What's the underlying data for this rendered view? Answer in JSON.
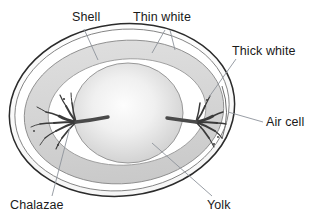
{
  "diagram": {
    "type": "labeled-biological-diagram",
    "labels": [
      {
        "id": "shell",
        "text": "Shell",
        "icon": "leader-line-icon",
        "position": "top-left",
        "points_to": "outer shell boundary"
      },
      {
        "id": "thin-white",
        "text": "Thin white",
        "icon": "leader-line-icon",
        "position": "top-center",
        "points_to": "thin albumen layer"
      },
      {
        "id": "thick-white",
        "text": "Thick white",
        "icon": "leader-line-icon",
        "position": "right-upper",
        "points_to": "thick albumen layer"
      },
      {
        "id": "air-cell",
        "text": "Air cell",
        "icon": "leader-line-icon",
        "position": "right",
        "points_to": "air cell at blunt end"
      },
      {
        "id": "chalazae",
        "text": "Chalazae",
        "icon": "leader-line-icon",
        "position": "bottom-left",
        "points_to": "chalaza strand"
      },
      {
        "id": "yolk",
        "text": "Yolk",
        "icon": "leader-line-icon",
        "position": "bottom-right",
        "points_to": "yolk sphere"
      }
    ],
    "colors": {
      "shell_outline": "#2b2b2b",
      "thick_white_fill": "#d4d4d4",
      "thick_white_outline": "#8a8a8a",
      "thin_white_fill": "#ffffff",
      "thin_white_outline": "#9a9a9a",
      "yolk_center": "#fbfbfb",
      "yolk_edge": "#cfcfcf",
      "yolk_outline": "#8a8a8a",
      "chalaza": "#3a3a3a",
      "leader_line": "#8d939b",
      "label_text": "#1a1a1a",
      "background": "#ffffff"
    }
  }
}
